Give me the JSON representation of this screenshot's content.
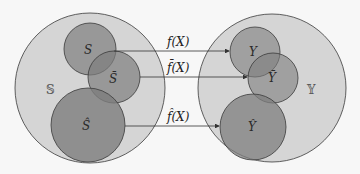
{
  "diagram": {
    "type": "set-mapping",
    "domain_set": {
      "label": "𝕊",
      "subsets": [
        {
          "id": "S",
          "label": "S"
        },
        {
          "id": "S_bar",
          "label": "S̄"
        },
        {
          "id": "S_hat",
          "label": "Ŝ"
        }
      ]
    },
    "codomain_set": {
      "label": "𝕐",
      "subsets": [
        {
          "id": "Y",
          "label": "Y"
        },
        {
          "id": "Y_bar",
          "label": "Ȳ"
        },
        {
          "id": "Y_hat",
          "label": "Ŷ"
        }
      ]
    },
    "mappings": [
      {
        "from": "S",
        "to": "Y",
        "label": "f(X)"
      },
      {
        "from": "S_bar",
        "to": "Y_bar",
        "label": "f̄(X)"
      },
      {
        "from": "S_hat",
        "to": "Y_hat",
        "label": "f̂(X)"
      }
    ],
    "colors": {
      "outer_fill": "#cfcfcf",
      "inner_fill": "#8a8a8a",
      "stroke": "#3a3a3a",
      "background": "#f7f7f7"
    }
  }
}
